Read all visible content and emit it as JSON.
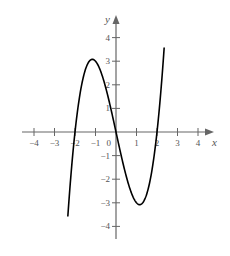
{
  "chart_data": {
    "type": "line",
    "title": "",
    "xlabel": "x",
    "ylabel": "y",
    "xlim": [
      -4.5,
      4.7
    ],
    "ylim": [
      -4.6,
      4.8
    ],
    "grid": false,
    "legend": null,
    "x_ticks": [
      -4,
      -3,
      -2,
      -1,
      1,
      2,
      3,
      4
    ],
    "x_tick_labels": [
      "−4",
      "−3",
      "−2",
      "−1",
      "1",
      "2",
      "3",
      "4"
    ],
    "y_ticks": [
      -4,
      -3,
      -2,
      -1,
      1,
      2,
      3,
      4
    ],
    "y_tick_labels": [
      "−4",
      "−3",
      "−2",
      "−1",
      "1",
      "2",
      "3",
      "4"
    ],
    "origin_label": "0",
    "series": [
      {
        "name": "f(x) = x^3 - 4x",
        "x": [
          -2.35,
          -2.0,
          -1.5,
          -1.15,
          -0.5,
          0.0,
          0.5,
          1.15,
          1.5,
          2.0,
          2.35
        ],
        "y": [
          -3.58,
          0.0,
          2.63,
          3.08,
          1.88,
          0.0,
          -1.88,
          -3.08,
          -2.63,
          0.0,
          3.58
        ]
      }
    ],
    "curve_color": "#000000",
    "axis_color": "#666666"
  }
}
